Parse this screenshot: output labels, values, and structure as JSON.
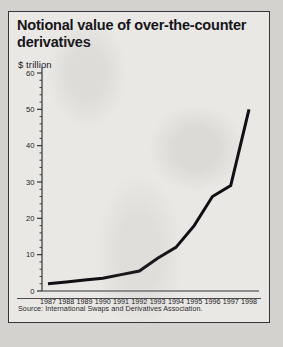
{
  "figure": {
    "title": "Notional value of over-the-counter derivatives",
    "subtitle": "$ trillion",
    "source": "Source: International Swaps and Derivatives Association."
  },
  "chart_data": {
    "type": "line",
    "title": "Notional value of over-the-counter derivatives",
    "subtitle": "$ trillion",
    "xlabel": "",
    "ylabel": "$ trillion",
    "categories": [
      "1987",
      "1988",
      "1989",
      "1990",
      "1991",
      "1992",
      "1993",
      "1994",
      "1995",
      "1996",
      "1997",
      "1998"
    ],
    "values": [
      2,
      2.5,
      3,
      3.5,
      4.5,
      5.5,
      9,
      12,
      18,
      26,
      29,
      50
    ],
    "series": [
      {
        "name": "Notional value of OTC derivatives",
        "values": [
          2,
          2.5,
          3,
          3.5,
          4.5,
          5.5,
          9,
          12,
          18,
          26,
          29,
          50
        ]
      }
    ],
    "ylim": [
      0,
      60
    ],
    "ymajor_ticks": [
      0,
      10,
      20,
      30,
      40,
      50,
      60
    ],
    "ymajor_tick_labels": [
      "0",
      "10",
      "20",
      "30",
      "40",
      "50",
      "60"
    ],
    "yminor_tick_step": 2,
    "grid": false,
    "legend": false,
    "line_color": "#100f14",
    "line_width": 3,
    "axis_color": "#35343a",
    "plot_background": "#e9e8e4"
  }
}
